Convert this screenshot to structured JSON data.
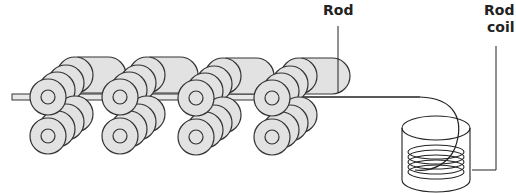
{
  "diagram": {
    "labels": {
      "rod": "Rod",
      "rod_coil_line1": "Rod",
      "rod_coil_line2": "coil"
    },
    "stands": [
      {
        "x": 48
      },
      {
        "x": 120
      },
      {
        "x": 196
      },
      {
        "x": 272
      }
    ],
    "colors": {
      "roller_fill": "#e2e2e2",
      "stroke": "#333333"
    }
  }
}
